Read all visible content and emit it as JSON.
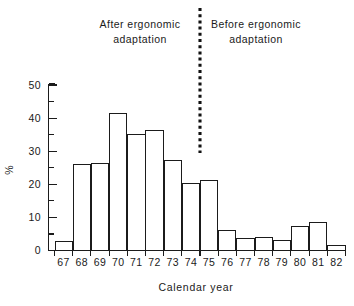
{
  "figure": {
    "background_color": "#ffffff",
    "ink_color": "#1b1b1b"
  },
  "chart_data": {
    "type": "bar",
    "title": "",
    "subtitle": "",
    "xlabel": "Calendar year",
    "ylabel": "%",
    "categories": [
      "67",
      "68",
      "69",
      "70",
      "71",
      "72",
      "73",
      "74",
      "75",
      "76",
      "77",
      "78",
      "79",
      "80",
      "81",
      "82"
    ],
    "values": [
      2.7,
      26.0,
      26.3,
      41.3,
      35.0,
      36.2,
      27.1,
      20.3,
      21.2,
      6.0,
      3.5,
      4.0,
      3.1,
      7.4,
      8.4,
      1.6
    ],
    "series": [
      {
        "name": "Percentage of cases",
        "values": [
          2.7,
          26.0,
          26.3,
          41.3,
          35.0,
          36.2,
          27.1,
          20.3,
          21.2,
          6.0,
          3.5,
          4.0,
          3.1,
          7.4,
          8.4,
          1.6
        ]
      }
    ],
    "ylim": [
      0,
      50
    ],
    "ymajor_ticks": [
      0,
      10,
      20,
      30,
      40,
      50
    ],
    "yminor_ticks": [
      5,
      15,
      25,
      35,
      45
    ],
    "ytick_labels": [
      "0",
      "10",
      "20",
      "30",
      "40",
      "50"
    ],
    "grid": false,
    "legend": false,
    "legend_position": "none",
    "bar_fill": "#ffffff",
    "bar_edge": "#1b1b1b",
    "annotations": [
      {
        "name": "after-ergonomic-adaptation",
        "line1": "After ergonomic",
        "line2": "adaptation",
        "side": "left"
      },
      {
        "name": "before-ergonomic-adaptation",
        "line1": "Before  ergonomic",
        "line2": "adaptation",
        "side": "right"
      }
    ],
    "divider": {
      "name": "vertical-dotted-divider",
      "style": "dotted",
      "between_categories": [
        "74",
        "75"
      ],
      "color": "#111111"
    }
  }
}
